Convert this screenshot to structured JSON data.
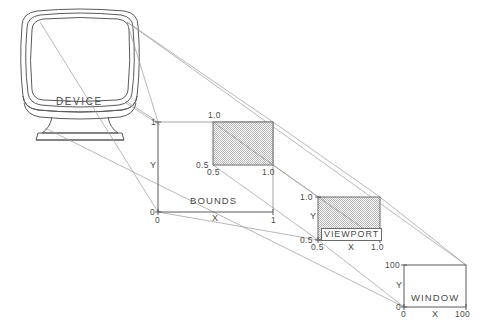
{
  "figure": {
    "type": "technical-diagram",
    "background_color": "#ffffff",
    "line_color": "#4a4a4a",
    "projection_line_color": "#8d8d8d",
    "shade_color": "#d4d4d4"
  },
  "device": {
    "label": "DEVICE"
  },
  "bounds": {
    "label": "BOUNDS",
    "axis_x_label": "X",
    "axis_y_label": "Y",
    "x_ticks": [
      "0",
      "1"
    ],
    "y_ticks": [
      "0",
      "1"
    ],
    "region_label_top": "1.0",
    "region_label_left": "0.5",
    "region_label_bottom_left": "0.5",
    "region_label_bottom_right": "1.0"
  },
  "viewport": {
    "label": "VIEWPORT",
    "axis_x_label": "X",
    "axis_y_label": "Y",
    "y_tick_top": "1.0",
    "y_tick_bottom": "0.5",
    "x_tick_left": "0.5",
    "x_tick_right": "1.0"
  },
  "window": {
    "label": "WINDOW",
    "axis_x_label": "X",
    "axis_y_label": "Y",
    "y_tick_top": "100",
    "y_tick_bottom": "0",
    "x_tick_left": "0",
    "x_tick_right": "100"
  }
}
